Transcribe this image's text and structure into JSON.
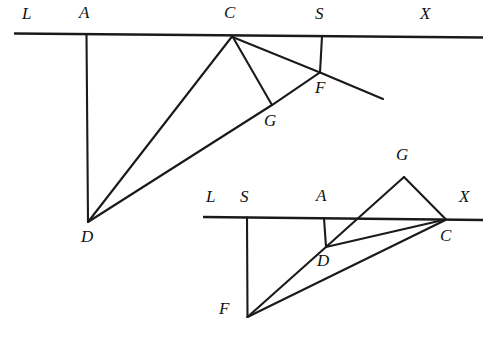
{
  "figure": {
    "stroke_color": "#1a1a1a",
    "background_color": "#ffffff"
  },
  "diagrams": [
    {
      "name": "upper-diagram",
      "baseline": {
        "label_left": "L",
        "label_right": "X",
        "x1": 14,
        "y1": 33.5,
        "x2": 483,
        "y2": 37.5
      },
      "points": [
        {
          "id": "L",
          "label": "L",
          "x": 24,
          "y": 37,
          "label_x": 22,
          "label_y": 5
        },
        {
          "id": "A",
          "label": "A",
          "x": 86,
          "y": 34,
          "label_x": 80,
          "label_y": 4
        },
        {
          "id": "C",
          "label": "C",
          "x": 232,
          "y": 36,
          "label_x": 225,
          "label_y": 4
        },
        {
          "id": "S",
          "label": "S",
          "x": 322,
          "y": 36,
          "label_x": 316,
          "label_y": 5
        },
        {
          "id": "X",
          "label": "X",
          "x": 470,
          "y": 37,
          "label_x": 421,
          "label_y": 5
        },
        {
          "id": "D",
          "label": "D",
          "x": 88,
          "y": 222,
          "label_x": 82,
          "label_y": 228
        },
        {
          "id": "G",
          "label": "G",
          "x": 272,
          "y": 105,
          "label_x": 264,
          "label_y": 110
        },
        {
          "id": "F",
          "label": "F",
          "x": 320,
          "y": 72,
          "label_x": 316,
          "label_y": 78
        }
      ],
      "segments": [
        {
          "name": "segment-A-D",
          "from": "A",
          "to": "D"
        },
        {
          "name": "segment-C-D",
          "from": "C",
          "to": "D"
        },
        {
          "name": "segment-C-G",
          "from": "C",
          "to": "G"
        },
        {
          "name": "segment-S-F",
          "from": "S",
          "to": "F"
        },
        {
          "name": "ray-D-through-G-F",
          "from": "D",
          "to": "F-extended"
        }
      ]
    },
    {
      "name": "lower-diagram",
      "baseline": {
        "label_left": "L",
        "label_right": "X",
        "x1": 203,
        "y1": 217,
        "x2": 483,
        "y2": 220
      },
      "points": [
        {
          "id": "L",
          "label": "L",
          "x": 212,
          "y": 220,
          "label_x": 209,
          "label_y": 189
        },
        {
          "id": "S",
          "label": "S",
          "x": 247,
          "y": 218,
          "label_x": 241,
          "label_y": 189
        },
        {
          "id": "A",
          "label": "A",
          "x": 324,
          "y": 218,
          "label_x": 317,
          "label_y": 188
        },
        {
          "id": "X",
          "label": "X",
          "x": 470,
          "y": 220,
          "label_x": 459,
          "label_y": 189
        },
        {
          "id": "C",
          "label": "C",
          "x": 445,
          "y": 219,
          "label_x": 441,
          "label_y": 226
        },
        {
          "id": "G",
          "label": "G",
          "x": 404,
          "y": 177,
          "label_x": 396,
          "label_y": 146
        },
        {
          "id": "D",
          "label": "D",
          "x": 326,
          "y": 247,
          "label_x": 318,
          "label_y": 252
        },
        {
          "id": "F",
          "label": "F",
          "x": 247,
          "y": 317,
          "label_x": 221,
          "label_y": 300
        }
      ],
      "segments": [
        {
          "name": "segment-S-F",
          "from": "S",
          "to": "F"
        },
        {
          "name": "segment-A-D",
          "from": "A",
          "to": "D"
        },
        {
          "name": "segment-F-D-G",
          "from": "F",
          "to": "G"
        },
        {
          "name": "segment-G-C",
          "from": "G",
          "to": "C"
        },
        {
          "name": "segment-D-C",
          "from": "D",
          "to": "C"
        },
        {
          "name": "segment-F-C",
          "from": "F",
          "to": "C"
        }
      ]
    }
  ],
  "labels": {
    "upper": {
      "L": "L",
      "A": "A",
      "C": "C",
      "S": "S",
      "X": "X",
      "D": "D",
      "G": "G",
      "F": "F"
    },
    "lower": {
      "L": "L",
      "S": "S",
      "A": "A",
      "X": "X",
      "C": "C",
      "G": "G",
      "D": "D",
      "F": "F"
    }
  }
}
